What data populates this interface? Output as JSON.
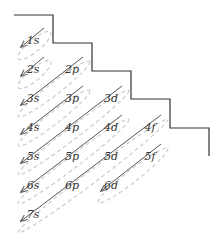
{
  "colors": {
    "outline": "#333333",
    "arrow": "#555555",
    "ellipse": "#c8c8c8",
    "text": "#333333",
    "background": "#ffffff"
  },
  "orbitals": [
    {
      "label": "1s",
      "x": 33,
      "y": 44
    },
    {
      "label": "2s",
      "x": 33,
      "y": 73
    },
    {
      "label": "2p",
      "x": 72,
      "y": 73
    },
    {
      "label": "3s",
      "x": 33,
      "y": 102
    },
    {
      "label": "3p",
      "x": 72,
      "y": 102
    },
    {
      "label": "3d",
      "x": 111,
      "y": 102
    },
    {
      "label": "4s",
      "x": 33,
      "y": 131
    },
    {
      "label": "4p",
      "x": 72,
      "y": 131
    },
    {
      "label": "4d",
      "x": 111,
      "y": 131
    },
    {
      "label": "4f",
      "x": 150,
      "y": 131
    },
    {
      "label": "5s",
      "x": 33,
      "y": 160
    },
    {
      "label": "5p",
      "x": 72,
      "y": 160
    },
    {
      "label": "5d",
      "x": 111,
      "y": 160
    },
    {
      "label": "5f",
      "x": 150,
      "y": 160
    },
    {
      "label": "6s",
      "x": 33,
      "y": 189
    },
    {
      "label": "6p",
      "x": 72,
      "y": 189
    },
    {
      "label": "6d",
      "x": 111,
      "y": 189
    },
    {
      "label": "7s",
      "x": 33,
      "y": 218
    }
  ],
  "filling_order": [
    "1s",
    "2s",
    "2p",
    "3s",
    "3p",
    "4s",
    "3d",
    "4p",
    "5s",
    "4d",
    "5p",
    "6s",
    "4f",
    "5d",
    "6p",
    "7s",
    "5f",
    "6d"
  ],
  "diagonals": [
    {
      "from": [
        44,
        28
      ],
      "to": [
        21,
        47
      ]
    },
    {
      "from": [
        44,
        57
      ],
      "to": [
        21,
        76
      ]
    },
    {
      "from": [
        83,
        57
      ],
      "to": [
        21,
        105
      ]
    },
    {
      "from": [
        83,
        86
      ],
      "to": [
        21,
        134
      ]
    },
    {
      "from": [
        122,
        86
      ],
      "to": [
        21,
        163
      ]
    },
    {
      "from": [
        122,
        115
      ],
      "to": [
        21,
        192
      ]
    },
    {
      "from": [
        161,
        115
      ],
      "to": [
        21,
        221
      ]
    },
    {
      "from": [
        161,
        144
      ],
      "to": [
        101,
        191
      ]
    }
  ],
  "staircase_points": "14,15 53,15 53,43 92,43 92,71 131,71 131,99 170,99 170,128 209,128 209,156"
}
